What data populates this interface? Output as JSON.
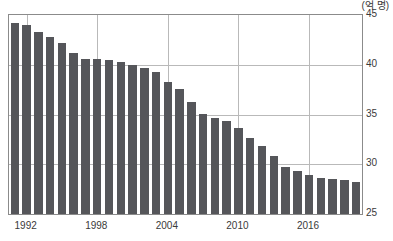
{
  "chart_data": {
    "type": "bar",
    "title": "",
    "subtitle": "",
    "unit_label": "(억 명)",
    "xlabel": "",
    "ylabel": "",
    "ylim": [
      25,
      45
    ],
    "y_ticks": [
      25,
      30,
      35,
      40,
      45
    ],
    "x_tick_labels": [
      "1992",
      "1998",
      "2004",
      "2010",
      "2016"
    ],
    "x_tick_years": [
      1992,
      1998,
      2004,
      2010,
      2016
    ],
    "grid": true,
    "legend": null,
    "bar_color": "#55565a",
    "axis_color": "#8b8b8b",
    "grid_color": "#b9b9b9",
    "categories": [
      1991,
      1992,
      1993,
      1994,
      1995,
      1996,
      1997,
      1998,
      1999,
      2000,
      2001,
      2002,
      2003,
      2004,
      2005,
      2006,
      2007,
      2008,
      2009,
      2010,
      2011,
      2012,
      2013,
      2014,
      2015,
      2016,
      2017,
      2018,
      2019,
      2020
    ],
    "values": [
      44.2,
      44.0,
      43.3,
      42.8,
      42.2,
      41.2,
      40.6,
      40.6,
      40.5,
      40.3,
      40.0,
      39.7,
      39.3,
      38.3,
      37.6,
      36.3,
      35.1,
      34.7,
      34.3,
      33.6,
      32.6,
      31.8,
      30.8,
      29.7,
      29.3,
      28.9,
      28.6,
      28.5,
      28.4,
      28.2
    ]
  }
}
